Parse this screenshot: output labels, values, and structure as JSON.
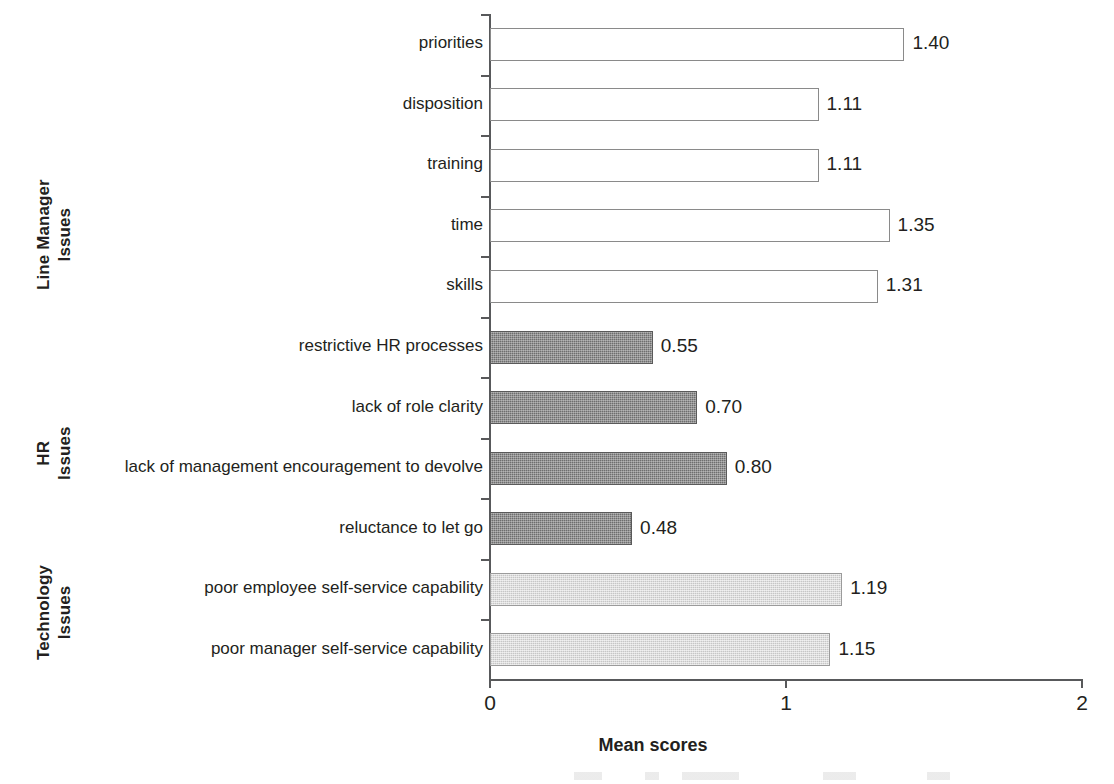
{
  "chart_data": {
    "type": "bar",
    "orientation": "horizontal",
    "title": "",
    "xlabel": "Mean scores",
    "ylabel": "",
    "xlim": [
      0,
      2
    ],
    "xticks": [
      "0",
      "1",
      "2"
    ],
    "xtick_values": [
      0,
      1,
      2
    ],
    "grid": false,
    "legend": "none",
    "value_label_format": "2dp",
    "groups": [
      {
        "name": "Line Manager Issues",
        "name_lines": [
          "Line Manager",
          "Issues"
        ],
        "fill": "white",
        "fill_color": "#ffffff",
        "border_color": "#8a8a8a",
        "categories": [
          "priorities",
          "disposition",
          "training",
          "time",
          "skills"
        ],
        "values": [
          1.4,
          1.11,
          1.11,
          1.35,
          1.31
        ],
        "value_labels": [
          "1.40",
          "1.11",
          "1.11",
          "1.35",
          "1.31"
        ]
      },
      {
        "name": "HR Issues",
        "name_lines": [
          "HR",
          "Issues"
        ],
        "fill": "dark",
        "fill_color": "#6e6e6e",
        "border_color": "#5a5a5a",
        "categories": [
          "restrictive HR processes",
          "lack of role clarity",
          "lack of management encouragement to devolve",
          "reluctance to let go"
        ],
        "values": [
          0.55,
          0.7,
          0.8,
          0.48
        ],
        "value_labels": [
          "0.55",
          "0.70",
          "0.80",
          "0.48"
        ]
      },
      {
        "name": "Technology Issues",
        "name_lines": [
          "Technology",
          "Issues"
        ],
        "fill": "light",
        "fill_color": "#dddddd",
        "border_color": "#9b9b9b",
        "categories": [
          "poor employee self-service capability",
          "poor manager self-service capability"
        ],
        "values": [
          1.19,
          1.15
        ],
        "value_labels": [
          "1.19",
          "1.15"
        ]
      }
    ],
    "categories": [
      "priorities",
      "disposition",
      "training",
      "time",
      "skills",
      "restrictive HR processes",
      "lack of role clarity",
      "lack of management encouragement to devolve",
      "reluctance to let go",
      "poor employee self-service capability",
      "poor manager self-service capability"
    ],
    "values": [
      1.4,
      1.11,
      1.11,
      1.35,
      1.31,
      0.55,
      0.7,
      0.8,
      0.48,
      1.19,
      1.15
    ]
  }
}
